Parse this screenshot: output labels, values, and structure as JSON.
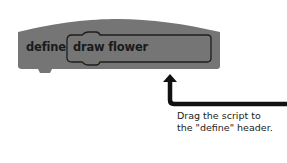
{
  "block": {
    "keyword": "define",
    "procedure_name": "draw flower",
    "fill_color": "#757575",
    "outline_color": "#1e1e1e"
  },
  "hint": {
    "line1": "Drag the script to",
    "line2": "the \"define\" header."
  },
  "arrow": {
    "icon": "arrow-up-icon",
    "color": "#111111"
  }
}
